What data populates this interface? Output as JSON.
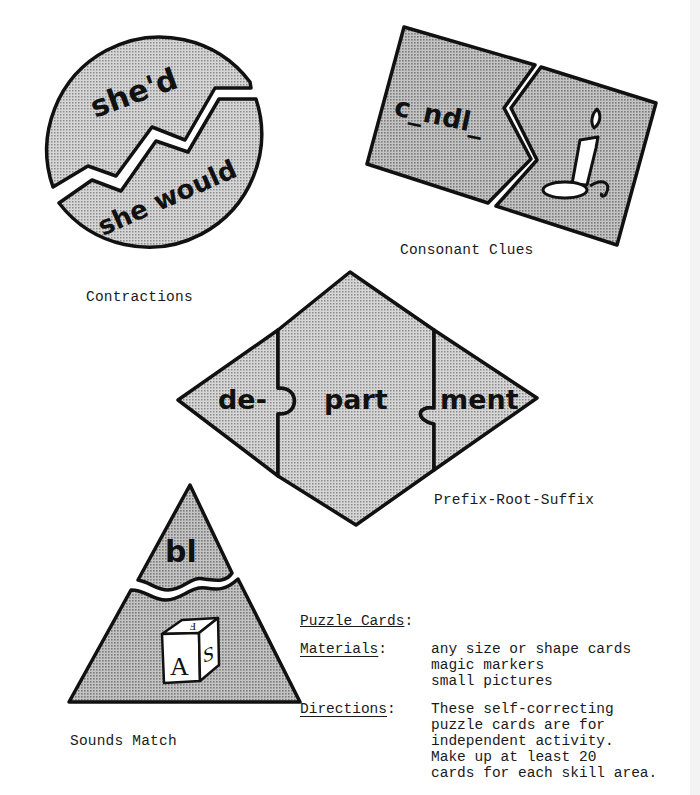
{
  "page": {
    "type": "activity-sheet",
    "background": "#ffffff",
    "shade_color": "#bdbdbd",
    "line_color": "#111111"
  },
  "cards": [
    {
      "id": "contractions",
      "shape": "circle",
      "caption": "Contractions",
      "pieces": [
        "she'd",
        "she would"
      ]
    },
    {
      "id": "consonant-clues",
      "shape": "rectangle",
      "caption": "Consonant Clues",
      "pieces": [
        "c_ndl_",
        "candle-picture"
      ]
    },
    {
      "id": "prefix-root-suffix",
      "shape": "diamond",
      "caption": "Prefix-Root-Suffix",
      "pieces": [
        "de-",
        "part",
        "ment"
      ]
    },
    {
      "id": "sounds-match",
      "shape": "triangle",
      "caption": "Sounds Match",
      "pieces": [
        "bl",
        "block-picture"
      ],
      "block_letters": [
        "A",
        "S",
        "F"
      ]
    }
  ],
  "info": {
    "title": "Puzzle Cards",
    "title_suffix": ":",
    "materials_label": "Materials",
    "materials_items": [
      "any size or shape cards",
      "magic markers",
      "small pictures"
    ],
    "directions_label": "Directions",
    "directions_lines": [
      "These self-correcting",
      "puzzle cards are for",
      "independent activity.",
      "Make up at least 20",
      "cards for each skill area."
    ]
  }
}
